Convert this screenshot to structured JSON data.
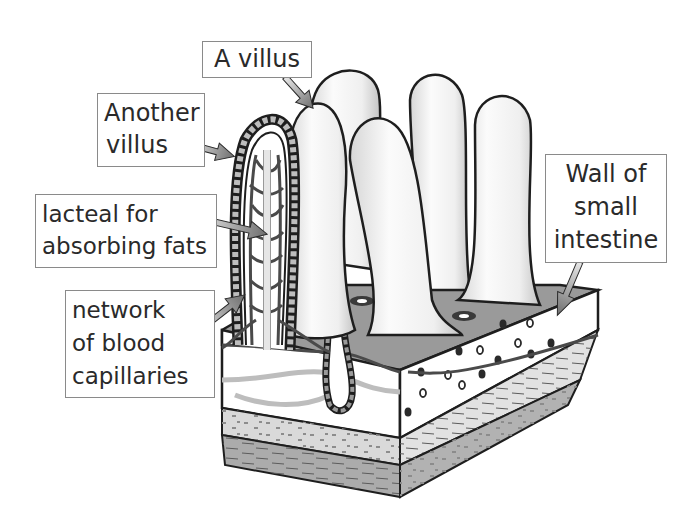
{
  "diagram": {
    "colors": {
      "outline": "#1e1e1e",
      "villus_fill": "#f4f4f4",
      "villus_shade": "#cfcfcf",
      "floor": "#9a9a9a",
      "wall_top_layer": "#ffffff",
      "muscle_layer_1": "#d9d9d9",
      "muscle_layer_2": "#a9a9a9",
      "capillary": "#4a4a4a",
      "lacteal": "#e6e6e6",
      "epithelium_cell": "#bdbdbd",
      "arrow_fill": "#8c8c8c",
      "label_border": "#8a8a8a",
      "label_text": "#2a2a2a"
    }
  },
  "labels": {
    "a_villus": {
      "lines": [
        "A villus"
      ]
    },
    "another_villus": {
      "lines": [
        "Another",
        "villus"
      ]
    },
    "lacteal": {
      "lines": [
        "lacteal for",
        "absorbing fats"
      ]
    },
    "capillaries": {
      "lines": [
        "network",
        "of blood",
        "capillaries"
      ]
    },
    "wall": {
      "lines": [
        "Wall of",
        "small",
        "intestine"
      ]
    }
  }
}
